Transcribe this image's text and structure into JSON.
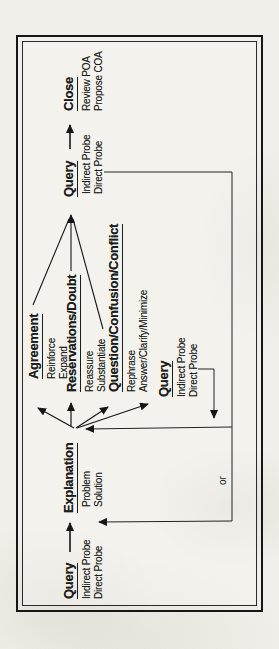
{
  "diagram": {
    "nodes": {
      "query_start": {
        "title": "Query",
        "items": [
          "Indirect Probe",
          "Direct Probe"
        ]
      },
      "explanation": {
        "title": "Explanation",
        "items": [
          "Problem",
          "Solution"
        ]
      },
      "agreement": {
        "title": "Agreement",
        "items": [
          "Reinforce",
          "Expand"
        ]
      },
      "reservations_doubt": {
        "title": "Reservations/Doubt",
        "items": [
          "Reassure",
          "Substantiate"
        ]
      },
      "question_confusion_conflict": {
        "title": "Question/Confusion/Conflict",
        "items": [
          "Rephrase",
          "Answer/Clarify/Minimize"
        ]
      },
      "query_mid": {
        "title": "Query",
        "items": [
          "Indirect Probe",
          "Direct Probe"
        ]
      },
      "query_end": {
        "title": "Query",
        "items": [
          "Indirect Probe",
          "Direct Probe"
        ]
      },
      "close": {
        "title": "Close",
        "items": [
          "Review POA",
          "Propose COA"
        ]
      }
    },
    "labels": {
      "or": "or"
    },
    "colors": {
      "ink": "#1c1c1c",
      "paper": "#f1efe9"
    }
  }
}
